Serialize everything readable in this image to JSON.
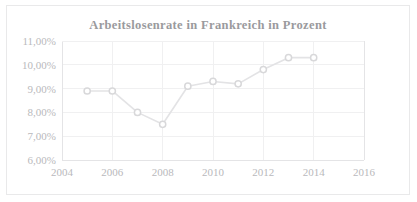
{
  "chart_data": {
    "type": "line",
    "title": "Arbeitslosenrate in Frankreich in Prozent",
    "xlabel": "",
    "ylabel": "",
    "x": [
      2005,
      2006,
      2007,
      2008,
      2009,
      2010,
      2011,
      2012,
      2013,
      2014
    ],
    "values": [
      8.9,
      8.9,
      8.0,
      7.5,
      9.1,
      9.3,
      9.2,
      9.8,
      10.3,
      10.3
    ],
    "series": [
      {
        "name": "Arbeitslosenrate",
        "values": [
          8.9,
          8.9,
          8.0,
          7.5,
          9.1,
          9.3,
          9.2,
          9.8,
          10.3,
          10.3
        ]
      }
    ],
    "xlim": [
      2004,
      2016
    ],
    "ylim": [
      6.0,
      11.0
    ],
    "xticks": [
      2004,
      2006,
      2008,
      2010,
      2012,
      2014,
      2016
    ],
    "xtick_labels": [
      "2004",
      "2006",
      "2008",
      "2010",
      "2012",
      "2014",
      "2016"
    ],
    "yticks": [
      6.0,
      7.0,
      8.0,
      9.0,
      10.0,
      11.0
    ],
    "ytick_labels": [
      "6,00%",
      "7,00%",
      "8,00%",
      "9,00%",
      "10,00%",
      "11,00%"
    ],
    "grid": true,
    "grid_axis": "both",
    "legend": false,
    "legend_position": "none",
    "marker": "circle-open",
    "colors": {
      "line": "#e3e3e5",
      "marker_fill": "#ffffff",
      "marker_stroke": "#d8d8da",
      "grid": "#f0f0f1",
      "axis": "#e4e4e6",
      "title_text": "#9a9a9d",
      "tick_text": "#b9b9bc",
      "frame_border": "#e9e9ea",
      "background": "#ffffff"
    }
  }
}
